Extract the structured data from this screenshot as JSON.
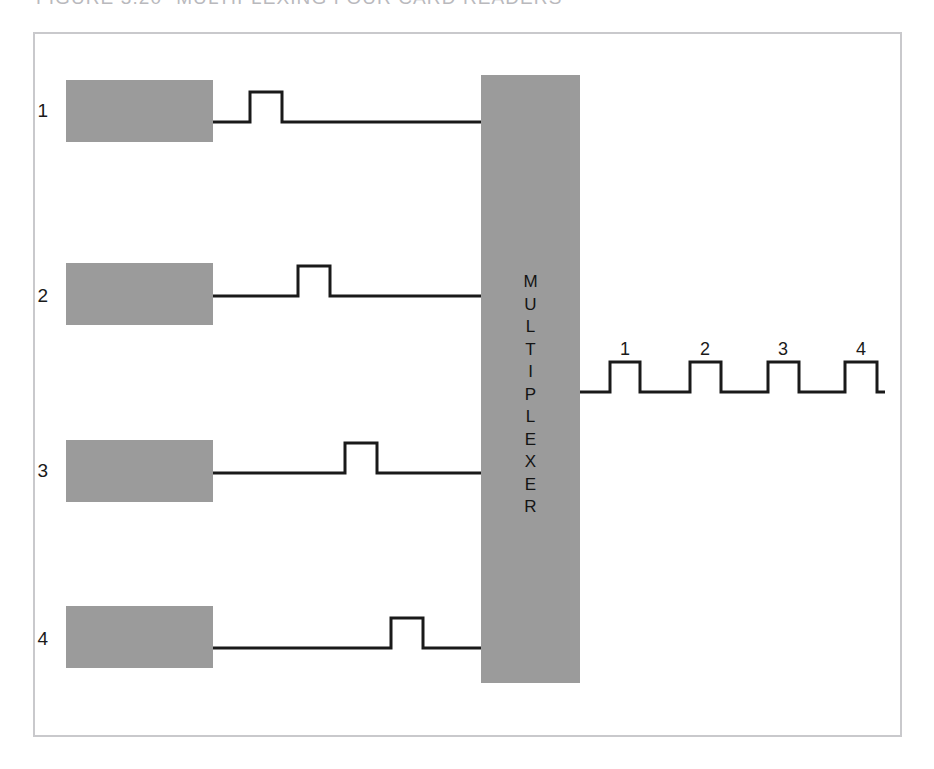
{
  "figure": {
    "number": "FIGURE 3.20",
    "title": "MULTIPLEXING FOUR CARD READERS"
  },
  "colors": {
    "block_gray": "#9b9b9b",
    "frame_border": "#c9c9cc",
    "line_black": "#1a1a1a",
    "caption_gray": "#b9b9bd",
    "page_white": "#ffffff",
    "speckle_white": "#f2f2f2"
  },
  "multiplexer": {
    "label": "MULTIPLEXER",
    "letters": [
      "M",
      "U",
      "L",
      "T",
      "I",
      "P",
      "L",
      "E",
      "X",
      "E",
      "R"
    ]
  },
  "card_readers": [
    {
      "index": "1",
      "label_x": 48,
      "label_y": 100,
      "block_x": 66,
      "block_y": 80
    },
    {
      "index": "2",
      "label_x": 48,
      "label_y": 285,
      "block_x": 66,
      "block_y": 263
    },
    {
      "index": "3",
      "label_x": 48,
      "label_y": 460,
      "block_x": 66,
      "block_y": 440
    },
    {
      "index": "4",
      "label_x": 48,
      "label_y": 628,
      "block_x": 66,
      "block_y": 606
    }
  ],
  "input_signals": [
    {
      "reader": "1",
      "baseline_y": 122,
      "pulse_top_y": 92,
      "pulse_start_x": 250,
      "pulse_end_x": 282,
      "line_start_x": 213,
      "line_end_x": 481
    },
    {
      "reader": "2",
      "baseline_y": 296,
      "pulse_top_y": 266,
      "pulse_start_x": 298,
      "pulse_end_x": 330,
      "line_start_x": 213,
      "line_end_x": 481
    },
    {
      "reader": "3",
      "baseline_y": 473,
      "pulse_top_y": 443,
      "pulse_start_x": 345,
      "pulse_end_x": 377,
      "line_start_x": 213,
      "line_end_x": 481
    },
    {
      "reader": "4",
      "baseline_y": 648,
      "pulse_top_y": 618,
      "pulse_start_x": 391,
      "pulse_end_x": 423,
      "line_start_x": 213,
      "line_end_x": 481
    }
  ],
  "output_signal": {
    "baseline_y": 392,
    "pulse_top_y": 362,
    "line_start_x": 580,
    "line_end_x": 885,
    "pulses": [
      {
        "index": "1",
        "start_x": 610,
        "end_x": 640,
        "label_y": 339
      },
      {
        "index": "2",
        "start_x": 690,
        "end_x": 721,
        "label_y": 339
      },
      {
        "index": "3",
        "start_x": 768,
        "end_x": 799,
        "label_y": 339
      },
      {
        "index": "4",
        "start_x": 845,
        "end_x": 877,
        "label_y": 339
      }
    ]
  }
}
